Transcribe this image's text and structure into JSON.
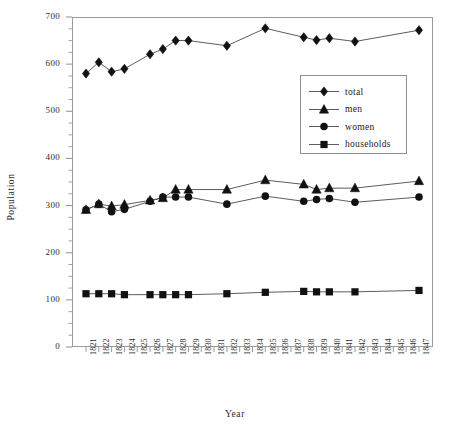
{
  "chart_data": {
    "type": "line",
    "title": "",
    "xlabel": "Year",
    "ylabel": "Population",
    "ylim": [
      0,
      700
    ],
    "ytick_step": 100,
    "yminor_step": 25,
    "grid": false,
    "legend_position": "upper-right",
    "categories": [
      "1821",
      "1822",
      "1823",
      "1824",
      "1825",
      "1826",
      "1827",
      "1828",
      "1829",
      "1830",
      "1831",
      "1832",
      "1833",
      "1834",
      "1835",
      "1836",
      "1837",
      "1838",
      "1839",
      "1840",
      "1841",
      "1842",
      "1843",
      "1844",
      "1845",
      "1846",
      "1847"
    ],
    "ytick_labels": [
      "0",
      "100",
      "200",
      "300",
      "400",
      "500",
      "600",
      "700"
    ],
    "series": [
      {
        "name": "total",
        "marker": "diamond",
        "x": [
          "1821",
          "1822",
          "1823",
          "1824",
          "1826",
          "1827",
          "1828",
          "1829",
          "1832",
          "1835",
          "1838",
          "1839",
          "1840",
          "1842",
          "1847"
        ],
        "values": [
          580,
          604,
          584,
          590,
          621,
          632,
          650,
          650,
          639,
          676,
          657,
          651,
          655,
          648,
          672
        ]
      },
      {
        "name": "men",
        "marker": "triangle",
        "x": [
          "1821",
          "1822",
          "1823",
          "1824",
          "1826",
          "1827",
          "1828",
          "1829",
          "1832",
          "1835",
          "1838",
          "1839",
          "1840",
          "1842",
          "1847"
        ],
        "values": [
          291,
          303,
          299,
          302,
          311,
          316,
          334,
          334,
          334,
          354,
          345,
          334,
          337,
          337,
          352
        ]
      },
      {
        "name": "women",
        "marker": "circle",
        "x": [
          "1821",
          "1822",
          "1823",
          "1824",
          "1826",
          "1827",
          "1828",
          "1829",
          "1832",
          "1835",
          "1838",
          "1839",
          "1840",
          "1842",
          "1847"
        ],
        "values": [
          291,
          303,
          287,
          292,
          309,
          318,
          318,
          318,
          303,
          320,
          309,
          313,
          315,
          307,
          318
        ]
      },
      {
        "name": "households",
        "marker": "square",
        "x": [
          "1821",
          "1822",
          "1823",
          "1824",
          "1826",
          "1827",
          "1828",
          "1829",
          "1832",
          "1835",
          "1838",
          "1839",
          "1840",
          "1842",
          "1847"
        ],
        "values": [
          113,
          113,
          113,
          111,
          111,
          111,
          111,
          111,
          113,
          116,
          118,
          117,
          117,
          117,
          120
        ]
      }
    ]
  },
  "legend": {
    "items": [
      {
        "label": "total",
        "marker": "diamond"
      },
      {
        "label": "men",
        "marker": "triangle"
      },
      {
        "label": "women",
        "marker": "circle"
      },
      {
        "label": "households",
        "marker": "square"
      }
    ]
  },
  "colors": {
    "series": "#111111",
    "frame": "#9a9a9a",
    "text": "#2e2e2e"
  }
}
